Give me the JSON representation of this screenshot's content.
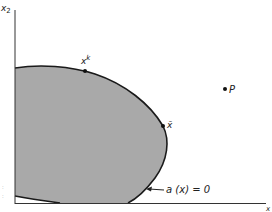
{
  "figure": {
    "axes": {
      "y_label": "x",
      "y_label_sub": "2",
      "x_label": "x",
      "x_label_sub": "1"
    },
    "region": {
      "fill_color": "#a9a9a9",
      "boundary_color": "#1a1a1a",
      "boundary_label": "a (x) = 0"
    },
    "points": {
      "xk": {
        "label": "x",
        "sup": "k"
      },
      "xbar": {
        "label": "x̄"
      },
      "p": {
        "label": "P"
      }
    }
  }
}
